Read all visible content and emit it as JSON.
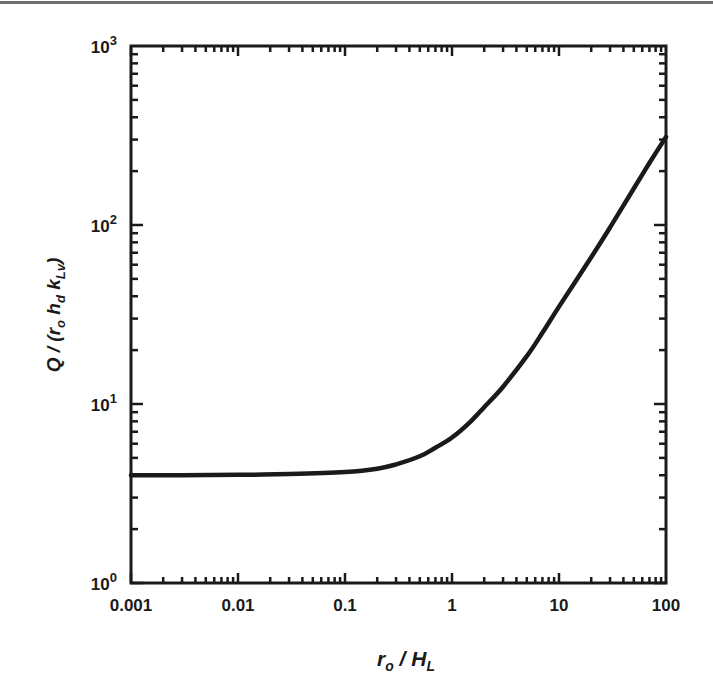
{
  "chart_data": {
    "type": "line",
    "title": "",
    "xlabel": "r_o / H_L",
    "ylabel": "Q / (r_o h_d k_Lv)",
    "xscale": "log",
    "yscale": "log",
    "xlim": [
      0.001,
      100
    ],
    "ylim": [
      1,
      1000
    ],
    "grid": false,
    "legend": null,
    "x_ticks": [
      "0.001",
      "0.01",
      "0.1",
      "1",
      "10",
      "100"
    ],
    "y_ticks": [
      {
        "base": "10",
        "exp": "0"
      },
      {
        "base": "10",
        "exp": "1"
      },
      {
        "base": "10",
        "exp": "2"
      },
      {
        "base": "10",
        "exp": "3"
      }
    ],
    "series": [
      {
        "name": "Q/(r_o h_d k_Lv)",
        "color": "#1a1a1a",
        "x": [
          0.001,
          0.003,
          0.01,
          0.03,
          0.1,
          0.2,
          0.3,
          0.5,
          0.7,
          1,
          1.5,
          2,
          3,
          5,
          7,
          10,
          20,
          30,
          50,
          70,
          100
        ],
        "y": [
          4.0,
          4.0,
          4.02,
          4.06,
          4.17,
          4.35,
          4.6,
          5.1,
          5.7,
          6.5,
          8.0,
          9.6,
          12.5,
          18.5,
          25,
          35,
          66,
          97,
          160,
          222,
          310
        ]
      }
    ]
  }
}
